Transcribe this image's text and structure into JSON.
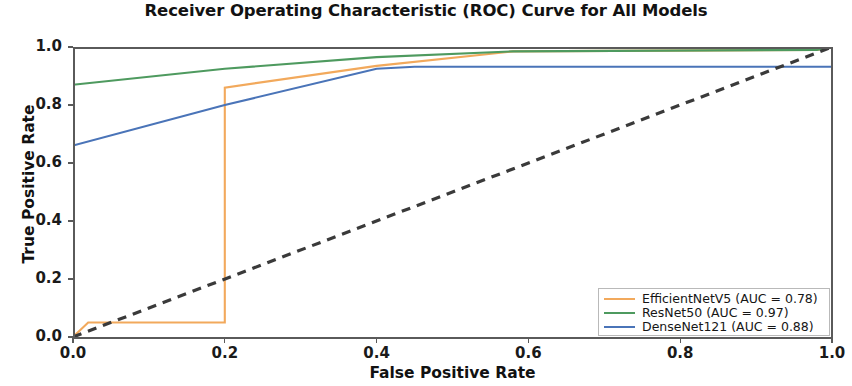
{
  "chart_data": {
    "type": "line",
    "title": "Receiver Operating Characteristic (ROC) Curve for All Models",
    "xlabel": "False Positive Rate",
    "ylabel": "True Positive Rate",
    "xlim": [
      0.0,
      1.0
    ],
    "ylim": [
      0.0,
      1.0
    ],
    "grid": false,
    "legend_position": "lower right",
    "xticks": [
      "0.0",
      "0.2",
      "0.4",
      "0.6",
      "0.8",
      "1.0"
    ],
    "xtick_values": [
      0.0,
      0.2,
      0.4,
      0.6,
      0.8,
      1.0
    ],
    "yticks": [
      "0.0",
      "0.2",
      "0.4",
      "0.6",
      "0.8",
      "1.0"
    ],
    "ytick_values": [
      0.0,
      0.2,
      0.4,
      0.6,
      0.8,
      1.0
    ],
    "series": [
      {
        "name": "EfficientNetV5 (AUC = 0.78)",
        "model": "EfficientNetV5",
        "auc": 0.78,
        "color": "#f2a95c",
        "style": "solid",
        "x": [
          0.0,
          0.02,
          0.2,
          0.2,
          0.4,
          0.58,
          0.98,
          1.0
        ],
        "y": [
          0.0,
          0.05,
          0.05,
          0.86,
          0.935,
          0.985,
          0.99,
          1.0
        ]
      },
      {
        "name": "ResNet50 (AUC = 0.97)",
        "model": "ResNet50",
        "auc": 0.97,
        "color": "#4e9a5f",
        "style": "solid",
        "x": [
          0.0,
          0.2,
          0.4,
          0.58,
          0.98,
          1.0
        ],
        "y": [
          0.87,
          0.925,
          0.965,
          0.985,
          0.99,
          1.0
        ]
      },
      {
        "name": "DenseNet121 (AUC = 0.88)",
        "model": "DenseNet121",
        "auc": 0.88,
        "color": "#4a74b8",
        "style": "solid",
        "x": [
          0.0,
          0.2,
          0.4,
          0.45,
          1.0
        ],
        "y": [
          0.66,
          0.8,
          0.925,
          0.932,
          0.932
        ]
      },
      {
        "name": "Chance level",
        "model": "Random",
        "color": "#3a3a3a",
        "style": "dashed",
        "x": [
          0.0,
          1.0
        ],
        "y": [
          0.0,
          1.0
        ]
      }
    ]
  },
  "legend": {
    "entries": [
      {
        "label": "EfficientNetV5 (AUC = 0.78)",
        "color": "#f2a95c"
      },
      {
        "label": "ResNet50 (AUC = 0.97)",
        "color": "#4e9a5f"
      },
      {
        "label": "DenseNet121 (AUC = 0.88)",
        "color": "#4a74b8"
      }
    ]
  }
}
